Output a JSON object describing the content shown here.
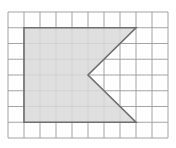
{
  "grid": {
    "cols": 10,
    "rows": 8,
    "origin_x": 8,
    "origin_y": 12,
    "cell_w": 16,
    "cell_h": 15.75,
    "line_color": "#9a9a9a",
    "border_color": "#b0b0b0"
  },
  "shape": {
    "description": "Rectangle with triangular notch cut from right side (flag/arrow-tail shape)",
    "vertices_grid": [
      [
        1,
        1
      ],
      [
        8,
        1
      ],
      [
        5,
        4
      ],
      [
        8,
        7
      ],
      [
        1,
        7
      ]
    ],
    "fill": "#d9d9d9",
    "stroke": "#6e6e6e"
  }
}
